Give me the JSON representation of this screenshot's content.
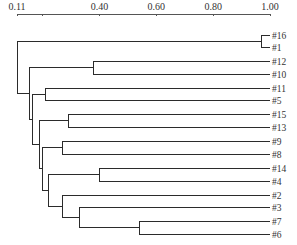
{
  "chart_data": {
    "type": "dendrogram",
    "title": "",
    "xlabel": "",
    "ylabel": "",
    "orientation": "horizontal",
    "axis": {
      "position": "top",
      "min": 0.11,
      "max": 1.0,
      "ticks": [
        0.11,
        0.2,
        0.4,
        0.6,
        0.8,
        1.0
      ],
      "tick_labels": [
        "0.11",
        "",
        "0.40",
        "0.60",
        "0.80",
        "1.00"
      ]
    },
    "leaves": [
      "#16",
      "#1",
      "#12",
      "#10",
      "#11",
      "#5",
      "#15",
      "#13",
      "#9",
      "#8",
      "#14",
      "#4",
      "#2",
      "#3",
      "#7",
      "#6"
    ],
    "merges": [
      {
        "left": "#16",
        "right": "#1",
        "similarity": 0.97
      },
      {
        "left": "#7",
        "right": "#6",
        "similarity": 0.54
      },
      {
        "left": "#14",
        "right": "#4",
        "similarity": 0.4
      },
      {
        "left": "#12",
        "right": "#10",
        "similarity": 0.38
      },
      {
        "left": "#15",
        "right": "#13",
        "similarity": 0.29
      },
      {
        "left": "#9",
        "right": "#8",
        "similarity": 0.27
      },
      {
        "left": "#3",
        "right": "(#7,#6)",
        "similarity": 0.33
      },
      {
        "left": "#2",
        "right": "(#3,(#7,#6))",
        "similarity": 0.27
      },
      {
        "left": "#11",
        "right": "#5",
        "similarity": 0.21
      },
      {
        "left": "(#14,#4)",
        "right": "(#2,...)",
        "similarity": 0.22
      },
      {
        "left": "(#9,#8)",
        "right": "(#14,#4,...)",
        "similarity": 0.2
      },
      {
        "left": "(#15,#13)",
        "right": "(#9,#8,...)",
        "similarity": 0.19
      },
      {
        "left": "(#11,#5)",
        "right": "(#15,#13,...)",
        "similarity": 0.15
      },
      {
        "left": "(#12,#10)",
        "right": "(#11,#5,...)",
        "similarity": 0.15
      },
      {
        "left": "(#16,#1)",
        "right": "rest",
        "similarity": 0.11
      }
    ],
    "grid": false,
    "legend": null
  },
  "layout": {
    "axis_x0": 17,
    "axis_x1": 270,
    "axis_y": 14,
    "leaf_x": 270,
    "leaf_y": [
      35,
      47,
      61,
      74,
      88,
      100,
      114,
      127,
      141,
      154,
      168,
      181,
      195,
      207,
      221,
      234
    ]
  }
}
